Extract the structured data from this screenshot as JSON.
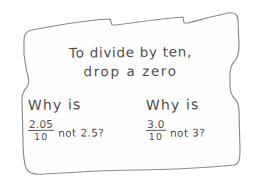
{
  "note": {
    "media": "hand-drawn sign with torn-paper border",
    "ink_color": "#4f4f4f",
    "border_color": "#8b8b8b",
    "paper_color": "#fefefe",
    "background_color": "#ffffff",
    "heading": {
      "line1": "To divide by ten,",
      "line2": "drop a zero"
    },
    "questions": [
      {
        "title": "Why is",
        "numerator": "2.05",
        "denominator": "10",
        "tail": "not 2.5?"
      },
      {
        "title": "Why is",
        "numerator": "3.0",
        "denominator": "10",
        "tail": "not 3?"
      }
    ]
  }
}
